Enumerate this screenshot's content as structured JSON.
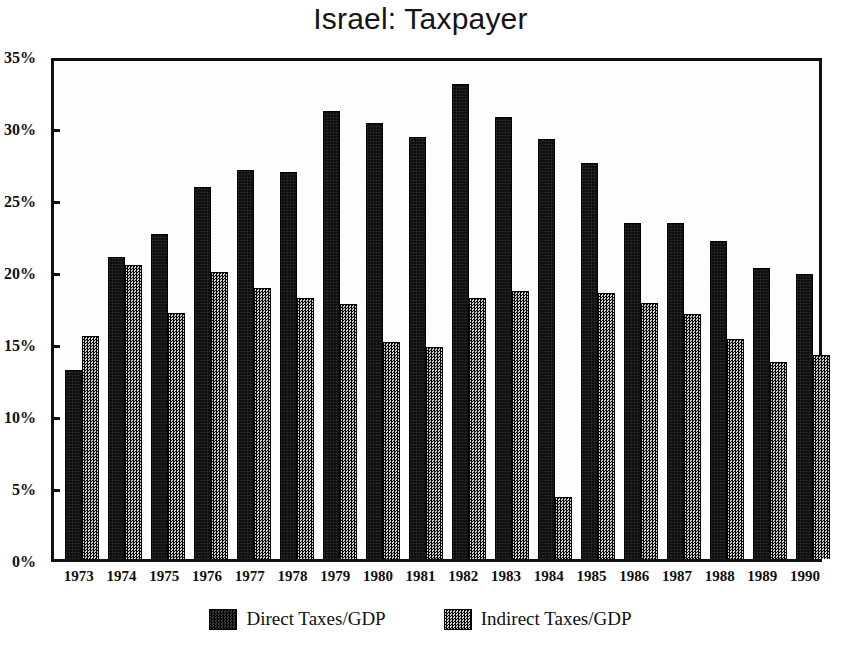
{
  "chart_data": {
    "type": "bar",
    "title": "Israel: Taxpayer",
    "xlabel": "",
    "ylabel": "",
    "ylim": [
      0,
      35
    ],
    "ytick_labels": [
      "0%",
      "5%",
      "10%",
      "15%",
      "20%",
      "25%",
      "30%",
      "35%"
    ],
    "ytick_values": [
      0,
      5,
      10,
      15,
      20,
      25,
      30,
      35
    ],
    "grid": false,
    "legend_position": "bottom-center",
    "categories": [
      "1973",
      "1974",
      "1975",
      "1976",
      "1977",
      "1978",
      "1979",
      "1980",
      "1981",
      "1982",
      "1983",
      "1984",
      "1985",
      "1986",
      "1987",
      "1988",
      "1989",
      "1990"
    ],
    "series": [
      {
        "name": "Direct Taxes/GDP",
        "color": "#0d0d0d",
        "values": [
          13.1,
          21.0,
          22.6,
          25.8,
          27.0,
          26.9,
          31.1,
          30.3,
          29.3,
          33.0,
          30.7,
          29.2,
          27.5,
          23.3,
          23.3,
          22.1,
          20.2,
          19.8
        ]
      },
      {
        "name": "Indirect Taxes/GDP",
        "color": "#7a7a7a",
        "values": [
          15.5,
          20.4,
          17.1,
          19.9,
          18.8,
          18.1,
          17.7,
          15.1,
          14.7,
          18.1,
          18.6,
          4.3,
          18.5,
          17.8,
          17.0,
          15.3,
          13.7,
          14.2
        ]
      }
    ]
  },
  "title": {
    "text": "Israel: Taxpayer"
  },
  "legend": {
    "entries": [
      {
        "label": "Direct Taxes/GDP",
        "swatch": "direct-swatch"
      },
      {
        "label": "Indirect Taxes/GDP",
        "swatch": "indirect-swatch"
      }
    ]
  }
}
